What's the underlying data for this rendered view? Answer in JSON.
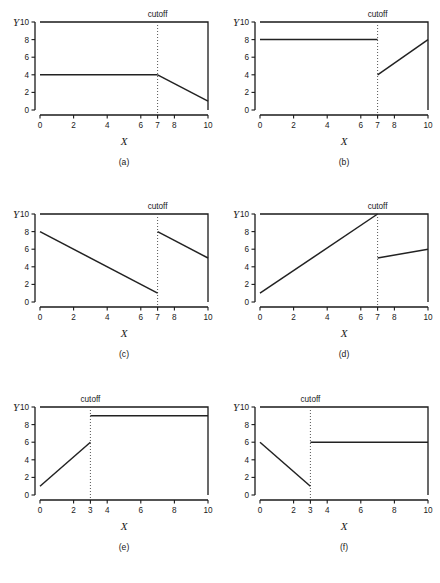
{
  "figure": {
    "background": "#ffffff",
    "line_color": "#222222",
    "axis_color": "#1a1a1a",
    "cutoff_color": "#555555",
    "columns": 2,
    "rows": 3
  },
  "chart_data": [
    {
      "type": "line",
      "panel": "a",
      "caption": "(a)",
      "title": "",
      "xlabel": "X",
      "ylabel": "Y",
      "xlim": [
        0,
        10
      ],
      "ylim": [
        0,
        10
      ],
      "xticks": [
        0,
        2,
        4,
        6,
        7,
        8,
        10
      ],
      "xticklabels": [
        "0",
        "2",
        "4",
        "6",
        "7",
        "8",
        "10"
      ],
      "yticks": [
        0,
        2,
        4,
        6,
        8,
        10
      ],
      "yticklabels": [
        "0",
        "2",
        "4",
        "6",
        "8",
        "10"
      ],
      "grid": false,
      "legend": null,
      "annotations": [
        {
          "text": "cutoff",
          "x": 7,
          "position": "top"
        }
      ],
      "cutoff": 7,
      "segments": [
        {
          "name": "left-segment",
          "x": [
            0,
            7
          ],
          "y": [
            4,
            4
          ]
        },
        {
          "name": "right-segment",
          "x": [
            7,
            10
          ],
          "y": [
            4,
            1
          ]
        }
      ],
      "jump_at_cutoff": 0
    },
    {
      "type": "line",
      "panel": "b",
      "caption": "(b)",
      "title": "",
      "xlabel": "X",
      "ylabel": "Y",
      "xlim": [
        0,
        10
      ],
      "ylim": [
        0,
        10
      ],
      "xticks": [
        0,
        2,
        4,
        6,
        7,
        8,
        10
      ],
      "xticklabels": [
        "0",
        "2",
        "4",
        "6",
        "7",
        "8",
        "10"
      ],
      "yticks": [
        0,
        2,
        4,
        6,
        8,
        10
      ],
      "yticklabels": [
        "0",
        "2",
        "4",
        "6",
        "8",
        "10"
      ],
      "grid": false,
      "legend": null,
      "annotations": [
        {
          "text": "cutoff",
          "x": 7,
          "position": "top"
        }
      ],
      "cutoff": 7,
      "segments": [
        {
          "name": "left-segment",
          "x": [
            0,
            7
          ],
          "y": [
            8,
            8
          ]
        },
        {
          "name": "right-segment",
          "x": [
            7,
            10
          ],
          "y": [
            4,
            8
          ]
        }
      ],
      "jump_at_cutoff": -4
    },
    {
      "type": "line",
      "panel": "c",
      "caption": "(c)",
      "title": "",
      "xlabel": "X",
      "ylabel": "Y",
      "xlim": [
        0,
        10
      ],
      "ylim": [
        0,
        10
      ],
      "xticks": [
        0,
        2,
        4,
        6,
        7,
        8,
        10
      ],
      "xticklabels": [
        "0",
        "2",
        "4",
        "6",
        "7",
        "8",
        "10"
      ],
      "yticks": [
        0,
        2,
        4,
        6,
        8,
        10
      ],
      "yticklabels": [
        "0",
        "2",
        "4",
        "6",
        "8",
        "10"
      ],
      "grid": false,
      "legend": null,
      "annotations": [
        {
          "text": "cutoff",
          "x": 7,
          "position": "top"
        }
      ],
      "cutoff": 7,
      "segments": [
        {
          "name": "left-segment",
          "x": [
            0,
            7
          ],
          "y": [
            8,
            1
          ]
        },
        {
          "name": "right-segment",
          "x": [
            7,
            10
          ],
          "y": [
            8,
            5
          ]
        }
      ],
      "jump_at_cutoff": 7
    },
    {
      "type": "line",
      "panel": "d",
      "caption": "(d)",
      "title": "",
      "xlabel": "X",
      "ylabel": "Y",
      "xlim": [
        0,
        10
      ],
      "ylim": [
        0,
        10
      ],
      "xticks": [
        0,
        2,
        4,
        6,
        7,
        8,
        10
      ],
      "xticklabels": [
        "0",
        "2",
        "4",
        "6",
        "7",
        "8",
        "10"
      ],
      "yticks": [
        0,
        2,
        4,
        6,
        8,
        10
      ],
      "yticklabels": [
        "0",
        "2",
        "4",
        "6",
        "8",
        "10"
      ],
      "grid": false,
      "legend": null,
      "annotations": [
        {
          "text": "cutoff",
          "x": 7,
          "position": "top"
        }
      ],
      "cutoff": 7,
      "segments": [
        {
          "name": "left-segment",
          "x": [
            0,
            7
          ],
          "y": [
            1,
            10
          ]
        },
        {
          "name": "right-segment",
          "x": [
            7,
            10
          ],
          "y": [
            5,
            6
          ]
        }
      ],
      "jump_at_cutoff": -5
    },
    {
      "type": "line",
      "panel": "e",
      "caption": "(e)",
      "title": "",
      "xlabel": "X",
      "ylabel": "Y",
      "xlim": [
        0,
        10
      ],
      "ylim": [
        0,
        10
      ],
      "xticks": [
        0,
        2,
        3,
        4,
        6,
        8,
        10
      ],
      "xticklabels": [
        "0",
        "2",
        "3",
        "4",
        "6",
        "8",
        "10"
      ],
      "yticks": [
        0,
        2,
        4,
        6,
        8,
        10
      ],
      "yticklabels": [
        "0",
        "2",
        "4",
        "6",
        "8",
        "10"
      ],
      "grid": false,
      "legend": null,
      "annotations": [
        {
          "text": "cutoff",
          "x": 3,
          "position": "top"
        }
      ],
      "cutoff": 3,
      "segments": [
        {
          "name": "left-segment",
          "x": [
            0,
            3
          ],
          "y": [
            1,
            6
          ]
        },
        {
          "name": "right-segment",
          "x": [
            3,
            10
          ],
          "y": [
            9,
            9
          ]
        }
      ],
      "jump_at_cutoff": 3
    },
    {
      "type": "line",
      "panel": "f",
      "caption": "(f)",
      "title": "",
      "xlabel": "X",
      "ylabel": "Y",
      "xlim": [
        0,
        10
      ],
      "ylim": [
        0,
        10
      ],
      "xticks": [
        0,
        2,
        3,
        4,
        6,
        8,
        10
      ],
      "xticklabels": [
        "0",
        "2",
        "3",
        "4",
        "6",
        "8",
        "10"
      ],
      "yticks": [
        0,
        2,
        4,
        6,
        8,
        10
      ],
      "yticklabels": [
        "0",
        "2",
        "4",
        "6",
        "8",
        "10"
      ],
      "grid": false,
      "legend": null,
      "annotations": [
        {
          "text": "cutoff",
          "x": 3,
          "position": "top"
        }
      ],
      "cutoff": 3,
      "segments": [
        {
          "name": "left-segment",
          "x": [
            0,
            3
          ],
          "y": [
            6,
            1
          ]
        },
        {
          "name": "right-segment",
          "x": [
            3,
            10
          ],
          "y": [
            6,
            6
          ]
        }
      ],
      "jump_at_cutoff": 5
    }
  ]
}
